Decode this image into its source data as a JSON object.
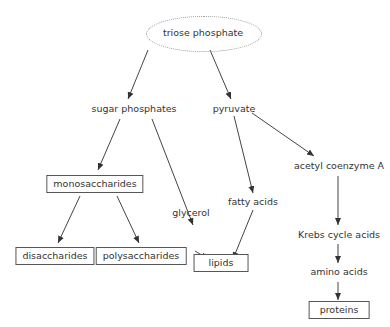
{
  "diagram": {
    "type": "flowchart",
    "nodes": {
      "triose_phosphate": "triose phosphate",
      "sugar_phosphates": "sugar phosphates",
      "pyruvate": "pyruvate",
      "monosaccharides": "monosaccharides",
      "acetyl_coenzyme_a": "acetyl coenzyme A",
      "glycerol": "glycerol",
      "fatty_acids": "fatty acids",
      "krebs_cycle_acids": "Krebs cycle acids",
      "disaccharides": "disaccharides",
      "polysaccharides": "polysaccharides",
      "lipids": "lipids",
      "amino_acids": "amino acids",
      "proteins": "proteins"
    },
    "edges": [
      [
        "triose phosphate",
        "sugar phosphates"
      ],
      [
        "triose phosphate",
        "pyruvate"
      ],
      [
        "sugar phosphates",
        "monosaccharides"
      ],
      [
        "sugar phosphates",
        "glycerol"
      ],
      [
        "pyruvate",
        "fatty acids"
      ],
      [
        "pyruvate",
        "acetyl coenzyme A"
      ],
      [
        "monosaccharides",
        "disaccharides"
      ],
      [
        "monosaccharides",
        "polysaccharides"
      ],
      [
        "glycerol",
        "lipids"
      ],
      [
        "fatty acids",
        "lipids"
      ],
      [
        "acetyl coenzyme A",
        "Krebs cycle acids"
      ],
      [
        "Krebs cycle acids",
        "amino acids"
      ],
      [
        "amino acids",
        "proteins"
      ]
    ]
  }
}
